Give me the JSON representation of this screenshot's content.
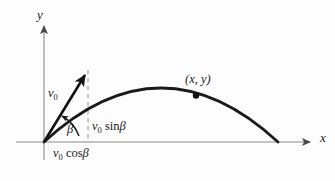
{
  "figure": {
    "background_color": "#fdfdfd",
    "axis_color": "#8a8a8a",
    "curve_color": "#1a1a1a",
    "vector_color": "#111111",
    "dashed_color": "#9a9a9a",
    "text_color": "#1a1a1a"
  },
  "axes": {
    "y_label": "y",
    "x_label": "x",
    "origin": {
      "x": 44,
      "y": 142
    },
    "x_end": {
      "x": 314,
      "y": 142
    },
    "y_top": {
      "x": 44,
      "y": 22
    }
  },
  "labels": {
    "v0": {
      "symbol": "v",
      "subscript": "0"
    },
    "beta": "β",
    "v0_sin_beta": {
      "symbol": "v",
      "subscript": "0",
      "func": "sin",
      "arg": "β"
    },
    "v0_cos_beta": {
      "symbol": "v",
      "subscript": "0",
      "func": "cos",
      "arg": "β"
    },
    "point_xy": "(x, y)"
  },
  "velocity_vector": {
    "from": {
      "x": 44,
      "y": 142
    },
    "to": {
      "x": 88,
      "y": 70
    },
    "angle_label": "β"
  },
  "dashed_line": {
    "from": {
      "x": 88,
      "y": 70
    },
    "to": {
      "x": 88,
      "y": 142
    }
  },
  "trajectory": {
    "launch": {
      "x": 44,
      "y": 142
    },
    "apex": {
      "x": 161,
      "y": 88
    },
    "landing": {
      "x": 278,
      "y": 142
    },
    "marker_point": {
      "x": 196,
      "y": 95
    }
  }
}
